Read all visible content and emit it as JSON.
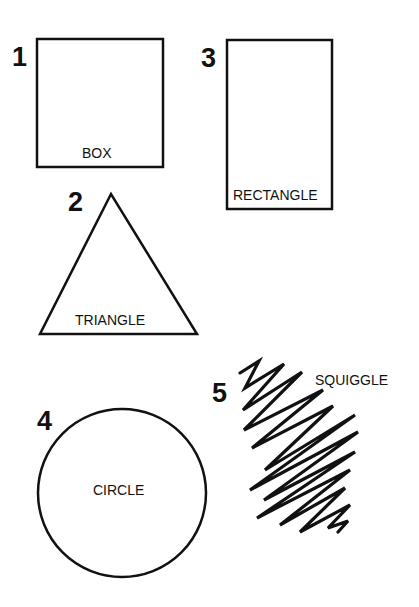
{
  "figure": {
    "shapes": [
      {
        "number": "1",
        "label": "BOX"
      },
      {
        "number": "2",
        "label": "TRIANGLE"
      },
      {
        "number": "3",
        "label": "RECTANGLE"
      },
      {
        "number": "4",
        "label": "CIRCLE"
      },
      {
        "number": "5",
        "label": "SQUIGGLE"
      }
    ],
    "stroke_color": "#111111",
    "background_color": "#ffffff"
  }
}
